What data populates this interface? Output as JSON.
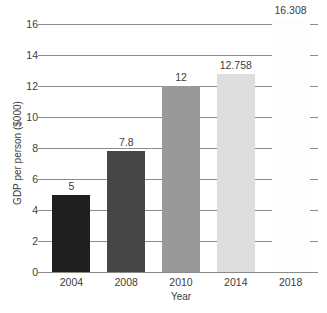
{
  "chart_data": {
    "type": "bar",
    "title": "",
    "subtitle": "",
    "xlabel": "Year",
    "ylabel": "GDP per person ($000)",
    "categories": [
      "2004",
      "2008",
      "2010",
      "2014",
      "2018"
    ],
    "values": [
      5,
      7.8,
      12,
      12.758,
      16.308
    ],
    "value_labels": [
      "5",
      "7.8",
      "12",
      "12.758",
      "16.308"
    ],
    "bar_colors": [
      "#1f1f1f",
      "#464646",
      "#999999",
      "#dedede",
      "#fdfdfd"
    ],
    "ylim": [
      0,
      16
    ],
    "yticks": [
      0,
      2,
      4,
      6,
      8,
      10,
      12,
      14,
      16
    ],
    "ytick_labels": [
      "0",
      "2",
      "4",
      "6",
      "8",
      "10",
      "12",
      "14",
      "16"
    ],
    "grid": true,
    "grid_color": "#8c8c8c",
    "legend": null,
    "legend_position": "none",
    "series": [
      {
        "name": "GDP per person ($000)",
        "values": [
          5,
          7.8,
          12,
          12.758,
          16.308
        ]
      }
    ]
  },
  "axes": {
    "y_title": "GDP per person ($000)",
    "x_title": "Year"
  }
}
